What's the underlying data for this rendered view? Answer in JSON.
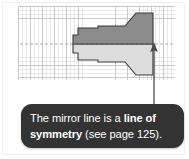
{
  "figure": {
    "kind": "geometry-illustration",
    "caption_parts": {
      "lead": "The mirror line is a ",
      "bold_1": "line of",
      "bold_2": "symmetry",
      "tail": " (see page 125)."
    },
    "caption_full": "The mirror line is a line of symmetry (see page 125).",
    "page_reference": "125"
  },
  "colors": {
    "callout_background": "#333333",
    "callout_text": "#ffffff",
    "shape_upper_fill": "#8c8c8c",
    "shape_lower_fill": "#dcdcdc",
    "shape_outline": "#3a3a3a",
    "grid_minor": "#e8e8e8",
    "grid_major": "#c9c9c9",
    "mirror_line": "#9a9a9a",
    "arrow": "#4a4a4a",
    "page_background": "#ffffff"
  },
  "grid": {
    "minor_cell_px": 4,
    "major_cell_px": 12,
    "columns_major": 13,
    "rows_major": 6
  },
  "shape": {
    "name": "mirror-symmetric-polygon",
    "upper_half_points": "55,38 55,29 60,29 60,22 80,22 80,20 107,20 118,7 135,7 135,38",
    "lower_half_points": "55,38 55,47 60,47 60,54 80,54 80,56 107,56 118,69 135,69 135,38",
    "mirror_axis_y": 38
  },
  "mirror_line": {
    "name": "mirror-line",
    "x1": 2,
    "x2": 157,
    "y": 38,
    "dash": "3,2"
  },
  "arrow": {
    "name": "pointer-arrow",
    "x": 154,
    "tip_y": 42,
    "tail_y": 105,
    "direction": "up"
  }
}
